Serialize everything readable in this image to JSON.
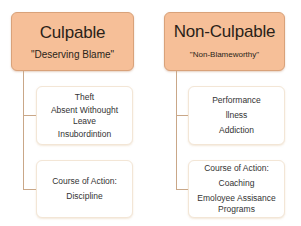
{
  "colors": {
    "header_fill": "#f6bf98",
    "header_border": "#d9a27a",
    "child_border": "#f3e6d6",
    "connector": "#c9a788"
  },
  "columns": [
    {
      "title": "Culpable",
      "subtitle": "\"Deserving Blame\"",
      "children": [
        {
          "lines": [
            "Theft",
            "Absent Withought Leave",
            "Insubordintion"
          ]
        },
        {
          "lines": [
            "Course of Action:",
            "Discipline"
          ]
        }
      ]
    },
    {
      "title": "Non-Culpable",
      "subtitle": "\"Non-Blameworthy\"",
      "children": [
        {
          "lines": [
            "Performance",
            "llness",
            "Addiction"
          ]
        },
        {
          "lines": [
            "Course of Action:",
            "Coaching",
            "Emoloyee Assisance Programs"
          ]
        }
      ]
    }
  ]
}
